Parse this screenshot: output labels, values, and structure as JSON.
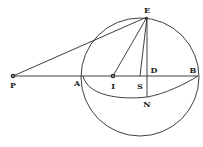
{
  "diagram": {
    "type": "geometric-construction",
    "labels": {
      "P": "P",
      "A": "A",
      "I": "I",
      "S": "S",
      "D": "D",
      "B": "B",
      "E": "E",
      "N": "N"
    },
    "ink_color": "#2a2a2a"
  }
}
